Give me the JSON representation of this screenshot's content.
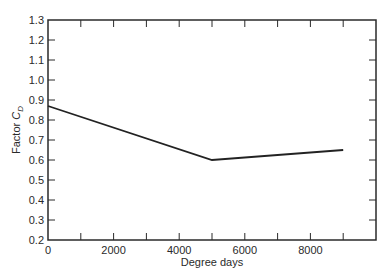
{
  "chart_data": {
    "type": "line",
    "title": "",
    "xlabel": "Degree days",
    "ylabel": "Factor C_D",
    "ylabel_main": "Factor ",
    "ylabel_symbol": "C",
    "ylabel_subscript": "D",
    "xlim": [
      0,
      10000
    ],
    "ylim": [
      0.2,
      1.3
    ],
    "x_ticks": [
      0,
      2000,
      4000,
      6000,
      8000
    ],
    "x_minor_ticks": [
      1000,
      3000,
      5000,
      7000,
      9000
    ],
    "y_ticks": [
      0.2,
      0.3,
      0.4,
      0.5,
      0.6,
      0.7,
      0.8,
      0.9,
      1.0,
      1.1,
      1.2,
      1.3
    ],
    "x_tick_labels": [
      "0",
      "2000",
      "4000",
      "6000",
      "8000"
    ],
    "y_tick_labels": [
      "0.2",
      "0.3",
      "0.4",
      "0.5",
      "0.6",
      "0.7",
      "0.8",
      "0.9",
      "1.0",
      "1.1",
      "1.2",
      "1.3"
    ],
    "grid": false,
    "legend": null,
    "series": [
      {
        "name": "C_D",
        "x": [
          0,
          5000,
          9000
        ],
        "y": [
          0.87,
          0.6,
          0.65
        ],
        "color": "#222222"
      }
    ]
  }
}
